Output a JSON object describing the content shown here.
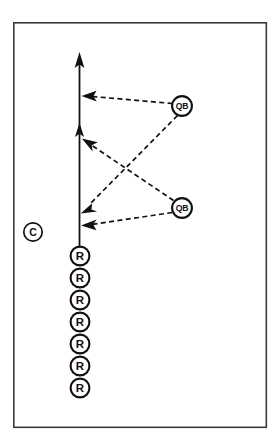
{
  "diagram": {
    "type": "football-play-diagram",
    "background_color": "#ffffff",
    "ink_color": "#111111",
    "frame": {
      "name": "field-border",
      "x": 13,
      "y": 22,
      "width": 254,
      "height": 406,
      "stroke_color": "#3a3a3a"
    },
    "markers": {
      "coach": {
        "label": "C",
        "name": "coach-marker",
        "cx": 33,
        "cy": 232,
        "r": 9.5
      },
      "quarterbacks": [
        {
          "label": "QB",
          "name": "quarterback-marker-top",
          "cx": 182,
          "cy": 106,
          "r": 10.2
        },
        {
          "label": "QB",
          "name": "quarterback-marker-bottom",
          "cx": 182,
          "cy": 208,
          "r": 10.2
        }
      ],
      "receivers": [
        {
          "label": "R",
          "name": "receiver-marker-1",
          "cx": 80,
          "cy": 256,
          "r": 9.6
        },
        {
          "label": "R",
          "name": "receiver-marker-2",
          "cx": 80,
          "cy": 278,
          "r": 9.6
        },
        {
          "label": "R",
          "name": "receiver-marker-3",
          "cx": 80,
          "cy": 300,
          "r": 9.6
        },
        {
          "label": "R",
          "name": "receiver-marker-4",
          "cx": 80,
          "cy": 322,
          "r": 9.6
        },
        {
          "label": "R",
          "name": "receiver-marker-5",
          "cx": 80,
          "cy": 344,
          "r": 9.6
        },
        {
          "label": "R",
          "name": "receiver-marker-6",
          "cx": 80,
          "cy": 366,
          "r": 9.6
        },
        {
          "label": "R",
          "name": "receiver-marker-7",
          "cx": 80,
          "cy": 388,
          "r": 9.6
        }
      ]
    },
    "route": {
      "name": "receiver-run-route",
      "description": "solid vertical line with upward arrow",
      "x": 79.5,
      "y_start": 246,
      "y_end": 55,
      "style": "solid",
      "arrow": "up"
    },
    "pass_routes": [
      {
        "name": "pass-route-top-qb-to-upper",
        "from": "quarterback-marker-top",
        "to_x": 82,
        "to_y": 97,
        "style": "dashed",
        "arrow": "left"
      },
      {
        "name": "pass-route-top-qb-to-lower",
        "from": "quarterback-marker-top",
        "to_x": 82,
        "to_y": 212,
        "style": "dashed",
        "arrow": "down-left"
      },
      {
        "name": "pass-route-bottom-qb-to-mid",
        "from": "quarterback-marker-bottom",
        "to_x": 82,
        "to_y": 140,
        "style": "dashed",
        "arrow": "up-left"
      },
      {
        "name": "pass-route-bottom-qb-to-bottom",
        "from": "quarterback-marker-bottom",
        "to_x": 82,
        "to_y": 225,
        "style": "dashed",
        "arrow": "left"
      }
    ],
    "route_arrows": [
      {
        "name": "route-arrow-top",
        "x": 79.5,
        "y": 55,
        "direction": "up"
      },
      {
        "name": "route-arrow-mid",
        "x": 79.5,
        "y": 128,
        "direction": "up"
      }
    ]
  }
}
